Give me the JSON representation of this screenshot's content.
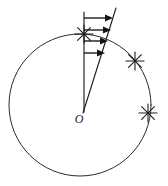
{
  "figure": {
    "type": "geometry-diagram",
    "canvas": {
      "width": 168,
      "height": 186
    },
    "background_color": "#ffffff",
    "line_color": "#2b2b2b",
    "arrow_color": "#141414",
    "labels": {
      "origin": "O"
    },
    "circle": {
      "name": "main-circle",
      "center_x": 80,
      "center_y": 105,
      "radius": 71
    },
    "radius_line": {
      "name": "vertical-radius",
      "x1": 84,
      "y1": 112,
      "x2": 84,
      "y2": 12
    },
    "slant_line": {
      "name": "velocity-profile-line",
      "x1": 83,
      "y1": 113,
      "x2": 116,
      "y2": 8
    },
    "arrows": [
      {
        "name": "velocity-arrow-1",
        "y": 18,
        "x_start": 84,
        "x_end": 112,
        "length": 28
      },
      {
        "name": "velocity-arrow-2",
        "y": 30,
        "x_start": 84,
        "x_end": 110,
        "length": 26
      },
      {
        "name": "velocity-arrow-3",
        "y": 41,
        "x_start": 84,
        "x_end": 107,
        "length": 23
      },
      {
        "name": "velocity-arrow-4",
        "y": 53,
        "x_start": 84,
        "x_end": 104,
        "length": 20
      }
    ],
    "star_markers": [
      {
        "name": "star-marker-top",
        "x": 84,
        "y": 34,
        "radius": 9
      },
      {
        "name": "star-marker-upper-right",
        "x": 135,
        "y": 61,
        "radius": 9
      },
      {
        "name": "star-marker-right",
        "x": 148,
        "y": 113,
        "radius": 9
      }
    ]
  }
}
